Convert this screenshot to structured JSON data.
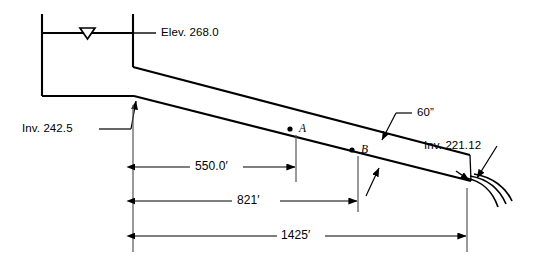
{
  "diagram": {
    "type": "engineering-profile-schematic",
    "stroke_color": "#000000",
    "background_color": "#ffffff",
    "labels": {
      "water_surface_elevation": "Elev. 268.0",
      "upstream_invert": "Inv. 242.5",
      "downstream_invert": "Inv. 221.12",
      "pipe_diameter": "60”",
      "point_a": "A",
      "point_b": "B"
    },
    "dimensions": [
      {
        "name": "distance-to-a",
        "value": "550.0′"
      },
      {
        "name": "distance-to-b",
        "value": "821′"
      },
      {
        "name": "total-pipe-length",
        "value": "1425′"
      }
    ],
    "icons": {
      "water_surface": "water-surface-triangle-icon",
      "discharge": "discharge-jet-icon"
    }
  }
}
